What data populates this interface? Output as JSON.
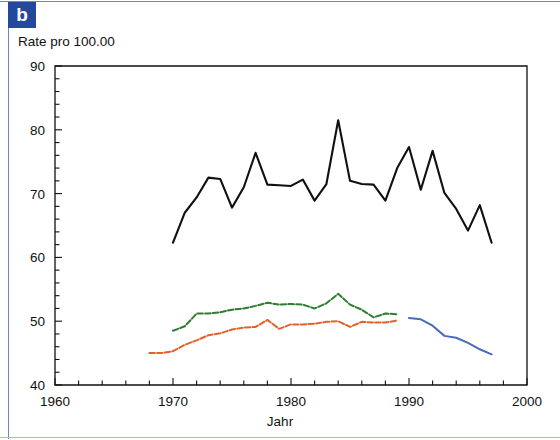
{
  "panel": {
    "letter": "b",
    "badge_color": "#24489b"
  },
  "frame": {
    "border_color": "#6f86c4"
  },
  "chart_data": {
    "type": "line",
    "title": "",
    "ylabel": "Rate pro 100.00",
    "xlabel": "Jahr",
    "xlim": [
      1960,
      2000
    ],
    "ylim": [
      40,
      90
    ],
    "xticks": [
      1960,
      1970,
      1980,
      1990,
      2000
    ],
    "xtick_labels": [
      "1960",
      "1970",
      "1980",
      "1990",
      "2000"
    ],
    "x_minor_tick_step": 2,
    "yticks": [
      40,
      50,
      60,
      70,
      80,
      90
    ],
    "ytick_labels": [
      "40",
      "50",
      "60",
      "70",
      "80",
      "90"
    ],
    "y_minor_tick_step": 2,
    "grid": false,
    "legend": "none",
    "series": [
      {
        "name": "black-series",
        "color": "#101010",
        "style": "solid",
        "width": 2.1,
        "x": [
          1970,
          1971,
          1972,
          1973,
          1974,
          1975,
          1976,
          1977,
          1978,
          1979,
          1980,
          1981,
          1982,
          1983,
          1984,
          1985,
          1986,
          1987,
          1988,
          1989,
          1990,
          1991,
          1992,
          1993,
          1994,
          1995,
          1996,
          1997
        ],
        "values": [
          62.3,
          67.0,
          69.4,
          72.5,
          72.3,
          67.8,
          71.0,
          76.4,
          71.4,
          71.3,
          71.2,
          72.2,
          68.9,
          71.5,
          81.5,
          72.0,
          71.5,
          71.4,
          68.9,
          74.0,
          77.3,
          70.6,
          76.7,
          70.1,
          67.6,
          64.2,
          68.2,
          62.3
        ]
      },
      {
        "name": "green-series",
        "color": "#2e7d32",
        "style": "dashed",
        "width": 2.0,
        "x": [
          1970,
          1971,
          1972,
          1973,
          1974,
          1975,
          1976,
          1977,
          1978,
          1979,
          1980,
          1981,
          1982,
          1983,
          1984,
          1985,
          1986,
          1987,
          1988,
          1989
        ],
        "values": [
          48.5,
          49.2,
          51.2,
          51.2,
          51.4,
          51.8,
          52.0,
          52.4,
          52.9,
          52.6,
          52.7,
          52.6,
          52.0,
          52.8,
          54.3,
          52.6,
          51.8,
          50.6,
          51.2,
          51.1
        ]
      },
      {
        "name": "orange-series",
        "color": "#e1622a",
        "style": "dashed",
        "width": 2.0,
        "x": [
          1968,
          1969,
          1970,
          1971,
          1972,
          1973,
          1974,
          1975,
          1976,
          1977,
          1978,
          1979,
          1980,
          1981,
          1982,
          1983,
          1984,
          1985,
          1986,
          1987,
          1988,
          1989
        ],
        "values": [
          45.0,
          45.0,
          45.3,
          46.3,
          47.0,
          47.8,
          48.1,
          48.7,
          49.0,
          49.1,
          50.2,
          48.8,
          49.5,
          49.5,
          49.6,
          49.9,
          50.0,
          49.1,
          49.9,
          49.8,
          49.8,
          50.1
        ]
      },
      {
        "name": "blue-series",
        "color": "#4a6bb5",
        "style": "solid",
        "width": 2.0,
        "x": [
          1990,
          1991,
          1992,
          1993,
          1994,
          1995,
          1996,
          1997
        ],
        "values": [
          50.5,
          50.3,
          49.3,
          47.7,
          47.4,
          46.6,
          45.6,
          44.8
        ]
      }
    ]
  }
}
